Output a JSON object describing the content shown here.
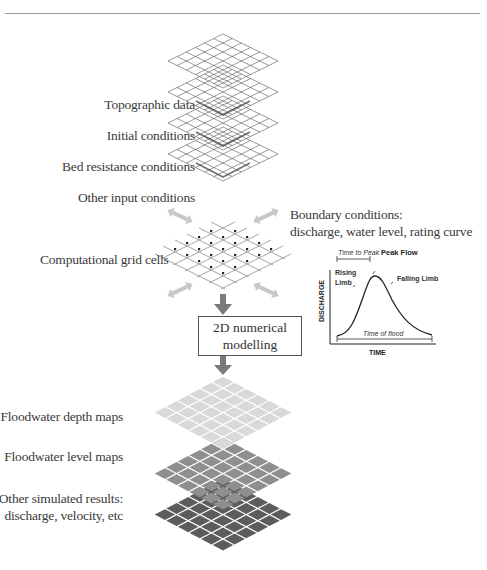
{
  "input_layers": [
    {
      "label": "Topographic data"
    },
    {
      "label": "Initial conditions"
    },
    {
      "label": "Bed resistance conditions"
    },
    {
      "label": "Other input conditions"
    }
  ],
  "computational_grid": {
    "label": "Computational grid cells"
  },
  "boundary": {
    "title_line1": "Boundary conditions:",
    "title_line2": "discharge, water level, rating curve"
  },
  "process_box": {
    "line1": "2D numerical",
    "line2": "modelling"
  },
  "output_layers": [
    {
      "label": "Floodwater depth maps",
      "color": "#d9d9d9"
    },
    {
      "label": "Floodwater level maps",
      "color": "#8f8f8f"
    },
    {
      "label_line1": "Other simulated results:",
      "label_line2": "discharge, velocity, etc",
      "color": "#5c5c5c"
    }
  ],
  "chart_data": {
    "type": "line",
    "xlabel": "TIME",
    "ylabel": "DISCHARGE",
    "annotations": [
      "Time to Peak",
      "Peak Flow",
      "Rising Limb",
      "Falling Limb",
      "Time of flood"
    ],
    "x": [
      0,
      1,
      2,
      3,
      4,
      5,
      6,
      7,
      8,
      9,
      10
    ],
    "values": [
      0.1,
      0.2,
      0.55,
      0.95,
      0.85,
      0.6,
      0.38,
      0.24,
      0.15,
      0.1,
      0.08
    ],
    "grid": false
  }
}
